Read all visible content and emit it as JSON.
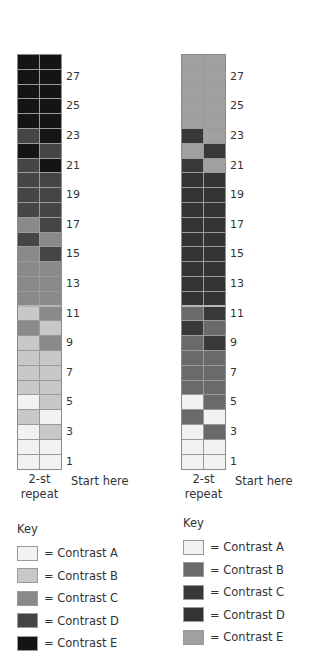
{
  "charts": [
    {
      "id": "left",
      "palette": {
        "A": "#f2f2f2",
        "B": "#c8c8c8",
        "C": "#8a8a8a",
        "D": "#454545",
        "E": "#141414"
      },
      "rows_top_to_bottom": [
        [
          "E",
          "E"
        ],
        [
          "E",
          "E"
        ],
        [
          "E",
          "E"
        ],
        [
          "E",
          "E"
        ],
        [
          "E",
          "E"
        ],
        [
          "D",
          "E"
        ],
        [
          "E",
          "D"
        ],
        [
          "D",
          "E"
        ],
        [
          "D",
          "D"
        ],
        [
          "D",
          "D"
        ],
        [
          "D",
          "D"
        ],
        [
          "C",
          "D"
        ],
        [
          "D",
          "C"
        ],
        [
          "C",
          "D"
        ],
        [
          "C",
          "C"
        ],
        [
          "C",
          "C"
        ],
        [
          "C",
          "C"
        ],
        [
          "B",
          "C"
        ],
        [
          "C",
          "B"
        ],
        [
          "B",
          "C"
        ],
        [
          "B",
          "B"
        ],
        [
          "B",
          "B"
        ],
        [
          "B",
          "B"
        ],
        [
          "A",
          "B"
        ],
        [
          "B",
          "A"
        ],
        [
          "A",
          "B"
        ],
        [
          "A",
          "A"
        ],
        [
          "A",
          "A"
        ]
      ],
      "row_labels": [
        "27",
        "25",
        "23",
        "21",
        "19",
        "17",
        "15",
        "13",
        "11",
        "9",
        "7",
        "5",
        "3",
        "1"
      ],
      "repeat_label": "2-st repeat",
      "start_label": "Start here",
      "key": {
        "title": "Key",
        "items": [
          {
            "code": "A",
            "label": "= Contrast A"
          },
          {
            "code": "B",
            "label": "= Contrast B"
          },
          {
            "code": "C",
            "label": "= Contrast C"
          },
          {
            "code": "D",
            "label": "= Contrast D"
          },
          {
            "code": "E",
            "label": "= Contrast E"
          }
        ]
      }
    },
    {
      "id": "right",
      "palette": {
        "A": "#f2f2f2",
        "B": "#6a6a6a",
        "C": "#383838",
        "D": "#333333",
        "E": "#a0a0a0"
      },
      "rows_top_to_bottom": [
        [
          "E",
          "E"
        ],
        [
          "E",
          "E"
        ],
        [
          "E",
          "E"
        ],
        [
          "E",
          "E"
        ],
        [
          "E",
          "E"
        ],
        [
          "C",
          "E"
        ],
        [
          "E",
          "C"
        ],
        [
          "C",
          "E"
        ],
        [
          "D",
          "D"
        ],
        [
          "D",
          "D"
        ],
        [
          "D",
          "D"
        ],
        [
          "D",
          "D"
        ],
        [
          "D",
          "D"
        ],
        [
          "D",
          "D"
        ],
        [
          "D",
          "D"
        ],
        [
          "D",
          "D"
        ],
        [
          "D",
          "D"
        ],
        [
          "B",
          "C"
        ],
        [
          "C",
          "B"
        ],
        [
          "B",
          "C"
        ],
        [
          "B",
          "B"
        ],
        [
          "B",
          "B"
        ],
        [
          "B",
          "B"
        ],
        [
          "A",
          "B"
        ],
        [
          "B",
          "A"
        ],
        [
          "A",
          "B"
        ],
        [
          "A",
          "A"
        ],
        [
          "A",
          "A"
        ]
      ],
      "row_labels": [
        "27",
        "25",
        "23",
        "21",
        "19",
        "17",
        "15",
        "13",
        "11",
        "9",
        "7",
        "5",
        "3",
        "1"
      ],
      "repeat_label": "2-st repeat",
      "start_label": "Start here",
      "key": {
        "title": "Key",
        "items": [
          {
            "code": "A",
            "label": "= Contrast A"
          },
          {
            "code": "B",
            "label": "= Contrast B"
          },
          {
            "code": "C",
            "label": "= Contrast C"
          },
          {
            "code": "D",
            "label": "= Contrast D"
          },
          {
            "code": "E",
            "label": "= Contrast E"
          }
        ]
      }
    }
  ],
  "labels": {
    "left_repeat_line1": "2-st",
    "left_repeat_line2": "repeat",
    "left_start": "Start here",
    "right_repeat_line1": "2-st",
    "right_repeat_line2": "repeat",
    "right_start": "Start here",
    "left_key_title": "Key",
    "right_key_title": "Key"
  }
}
